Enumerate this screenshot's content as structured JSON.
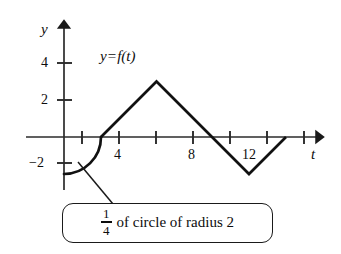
{
  "figure": {
    "curve_label": {
      "y": "y",
      "equals": "=",
      "f_of_t": "f(t)"
    },
    "axes": {
      "y_axis_name": "y",
      "x_axis_name": "t",
      "y_tick_labels": [
        "4",
        "2",
        "−2"
      ],
      "x_tick_labels": [
        "4",
        "8",
        "12"
      ]
    },
    "callout": {
      "fraction_numerator": "1",
      "fraction_denominator": "4",
      "text": "of circle of radius 2"
    },
    "colors": {
      "ink": "#0d0d0d",
      "axis": "#333333",
      "background": "#ffffff"
    }
  },
  "chart_data": {
    "type": "line",
    "xlabel": "t",
    "ylabel": "y",
    "xlim": [
      -1,
      15.5
    ],
    "ylim": [
      -3.2,
      5.2
    ],
    "grid": false,
    "legend": "none",
    "x_ticks": [
      2,
      4,
      6,
      8,
      10,
      12,
      14
    ],
    "x_tick_labels_shown": {
      "4": "4",
      "8": "8",
      "12": "12"
    },
    "y_ticks": [
      4,
      2,
      -2
    ],
    "y_tick_labels_shown": {
      "4": "4",
      "2": "2",
      "-2": "−2"
    },
    "segments": [
      {
        "name": "quarter-circle",
        "kind": "arc",
        "description": "1/4 of circle of radius 2 centered at (2,-2)",
        "center": [
          2,
          -2
        ],
        "radius": 2,
        "from": [
          0,
          -2
        ],
        "to": [
          2,
          0
        ]
      },
      {
        "name": "rising-line",
        "kind": "line",
        "from": [
          2,
          0
        ],
        "to": [
          5,
          3
        ]
      },
      {
        "name": "falling-line",
        "kind": "line",
        "from": [
          5,
          3
        ],
        "to": [
          8,
          0
        ]
      },
      {
        "name": "falling-line-below-axis",
        "kind": "line",
        "from": [
          8,
          0
        ],
        "to": [
          10,
          -2
        ]
      },
      {
        "name": "rising-line-to-axis",
        "kind": "line",
        "from": [
          10,
          -2
        ],
        "to": [
          12,
          0
        ]
      }
    ],
    "key_points": [
      {
        "x": 0,
        "y": -2,
        "label": "start"
      },
      {
        "x": 2,
        "y": 0,
        "label": "arc meets axis"
      },
      {
        "x": 5,
        "y": 3,
        "label": "peak"
      },
      {
        "x": 8,
        "y": 0,
        "label": "zero crossing"
      },
      {
        "x": 10,
        "y": -2,
        "label": "minimum"
      },
      {
        "x": 12,
        "y": 0,
        "label": "end"
      }
    ],
    "annotations": [
      {
        "text": "y = f(t)",
        "x": 4.2,
        "y": 4.0
      },
      {
        "text": "1/4 of circle of radius 2",
        "x": 3.5,
        "y": -4.6,
        "points_to": [
          1.2,
          -1.4
        ]
      }
    ]
  }
}
